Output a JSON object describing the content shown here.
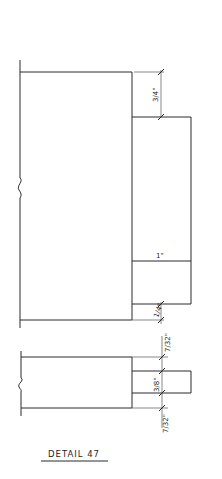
{
  "drawing": {
    "title": "DETAIL 47",
    "line_color": "#2a2a2a",
    "background": "#ffffff"
  },
  "upper_section": {
    "dimensions": {
      "top_offset": "3/4\"",
      "tab_depth": "1\"",
      "bottom_offset": "1/4\""
    }
  },
  "lower_section": {
    "dimensions": {
      "top_offset": "7/32\"",
      "tab_thickness": "3/8\"",
      "bottom_offset": "7/32\""
    }
  }
}
